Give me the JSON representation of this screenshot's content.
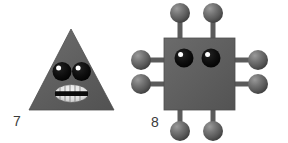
{
  "canvas": {
    "width": 288,
    "height": 143,
    "background": "#ffffff"
  },
  "palette": {
    "body_gray": "#5e5e5e",
    "body_gray_light": "#6f6f6f",
    "body_gray_dark": "#4c4c4c",
    "ball_light": "#8a8a8a",
    "ball_mid": "#636363",
    "ball_dark": "#3f3f3f",
    "eye_black": "#0a0a0a",
    "eye_highlight": "#ffffff",
    "mouth_light": "#e8e8e8",
    "mouth_band": "#0d0d0d",
    "label_color": "#3a3a3a",
    "outline": "#4a4a4a"
  },
  "figures": [
    {
      "id": "figure-7",
      "label": "7",
      "shape": "triangle",
      "description": "gray triangle creature with two eyes and a toothy oval mouth",
      "legs": 0,
      "eyes": 2,
      "mouth": "oval-with-teeth",
      "geometry": {
        "apex_x": 71,
        "apex_y": 29,
        "base_left_x": 29,
        "base_right_x": 114,
        "base_y": 110
      }
    },
    {
      "id": "figure-8",
      "label": "8",
      "shape": "square",
      "description": "gray square creature with eight ball-tipped legs and two eyes",
      "legs": 8,
      "eyes": 2,
      "mouth": "none",
      "geometry": {
        "left": 164,
        "top": 38,
        "right": 235,
        "bottom": 110
      },
      "leg_positions": [
        "top-left",
        "top-right",
        "left-upper",
        "left-lower",
        "right-upper",
        "right-lower",
        "bottom-left",
        "bottom-right"
      ]
    }
  ],
  "labels": {
    "figure_7": "7",
    "figure_8": "8"
  }
}
